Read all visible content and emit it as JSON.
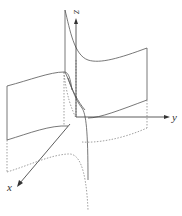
{
  "figure": {
    "axes": {
      "x_label": "x",
      "y_label": "y",
      "z_label": "z"
    },
    "colors": {
      "line": "#555555",
      "axis": "#333333",
      "background": "#ffffff"
    }
  }
}
